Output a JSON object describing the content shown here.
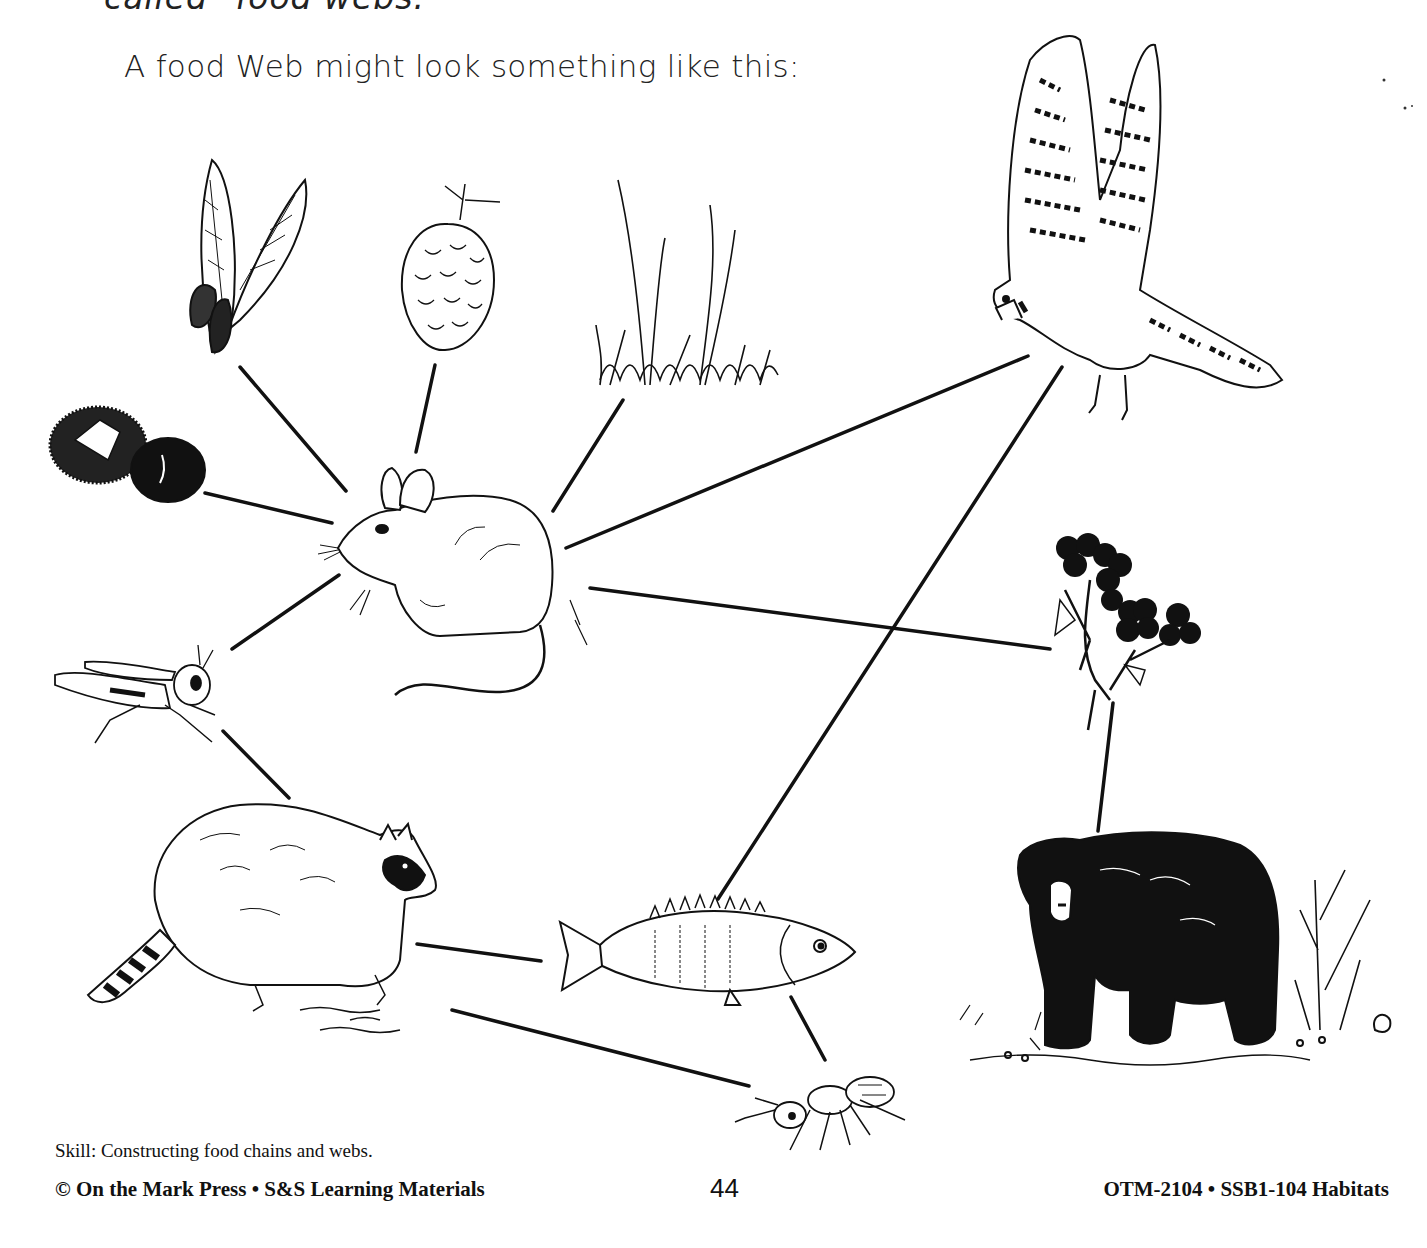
{
  "header": {
    "cutoff_line": "called \"food webs.\"",
    "intro": "A food Web might look something like this:"
  },
  "diagram": {
    "title": "Food web",
    "organisms": [
      {
        "id": "maple-seeds",
        "label": "Maple seeds",
        "role": "producer"
      },
      {
        "id": "pine-cone",
        "label": "Pine cone",
        "role": "producer"
      },
      {
        "id": "grass",
        "label": "Grass",
        "role": "producer"
      },
      {
        "id": "chestnut",
        "label": "Chestnut",
        "role": "producer"
      },
      {
        "id": "mouse",
        "label": "Mouse",
        "role": "consumer"
      },
      {
        "id": "grasshopper",
        "label": "Grasshopper",
        "role": "consumer"
      },
      {
        "id": "hawk",
        "label": "Hawk (kestrel)",
        "role": "consumer"
      },
      {
        "id": "berries",
        "label": "Berries",
        "role": "producer"
      },
      {
        "id": "raccoon",
        "label": "Raccoon",
        "role": "consumer"
      },
      {
        "id": "fish",
        "label": "Fish (perch)",
        "role": "consumer"
      },
      {
        "id": "ant",
        "label": "Ant",
        "role": "consumer"
      },
      {
        "id": "bear",
        "label": "Black bear",
        "role": "consumer"
      }
    ],
    "links": [
      {
        "from": "maple-seeds",
        "to": "mouse"
      },
      {
        "from": "pine-cone",
        "to": "mouse"
      },
      {
        "from": "grass",
        "to": "mouse"
      },
      {
        "from": "chestnut",
        "to": "mouse"
      },
      {
        "from": "grasshopper",
        "to": "mouse"
      },
      {
        "from": "mouse",
        "to": "hawk"
      },
      {
        "from": "mouse",
        "to": "berries"
      },
      {
        "from": "grasshopper",
        "to": "raccoon"
      },
      {
        "from": "fish",
        "to": "hawk"
      },
      {
        "from": "fish",
        "to": "raccoon"
      },
      {
        "from": "ant",
        "to": "raccoon"
      },
      {
        "from": "ant",
        "to": "fish"
      },
      {
        "from": "berries",
        "to": "bear"
      }
    ]
  },
  "footer": {
    "skill": "Skill:  Constructing food chains and webs.",
    "publisher": "© On the Mark Press • S&S Learning Materials",
    "page_number": "44",
    "series": "OTM-2104 • SSB1-104 Habitats"
  }
}
